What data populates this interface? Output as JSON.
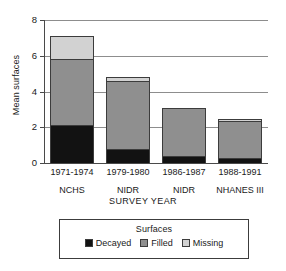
{
  "chart_data": {
    "type": "bar",
    "subtype": "stacked-vertical",
    "title": "",
    "xlabel": "SURVEY YEAR",
    "ylabel": "Mean surfaces",
    "ylim": [
      0,
      8
    ],
    "yticks": [
      0,
      2,
      4,
      6,
      8
    ],
    "ytick_labels": [
      "0",
      "2",
      "4",
      "6",
      "8"
    ],
    "grid": true,
    "grid_axis": "y",
    "legend_position": "below-plot",
    "legend_title": "Surfaces",
    "categories": [
      "1971-1974 NCHS",
      "1979-1980 NIDR",
      "1986-1987 NIDR",
      "1988-1991 NHANES III"
    ],
    "category_lines": [
      {
        "year": "1971-1974",
        "survey": "NCHS"
      },
      {
        "year": "1979-1980",
        "survey": "NIDR"
      },
      {
        "year": "1986-1987",
        "survey": "NIDR"
      },
      {
        "year": "1988-1991",
        "survey": "NHANES III"
      }
    ],
    "series": [
      {
        "name": "Decayed",
        "color": "#121212",
        "values": [
          2.1,
          0.8,
          0.4,
          0.3
        ]
      },
      {
        "name": "Filled",
        "color": "#8f8f8f",
        "values": [
          3.7,
          3.8,
          2.65,
          2.05
        ]
      },
      {
        "name": "Missing",
        "color": "#d2d2d2",
        "values": [
          1.3,
          0.2,
          0.05,
          0.1
        ]
      }
    ],
    "totals": [
      7.1,
      4.8,
      3.1,
      2.45
    ]
  },
  "axis": {
    "y_title": "Mean surfaces",
    "x_title": "SURVEY YEAR",
    "y_tick_0": "0",
    "y_tick_1": "2",
    "y_tick_2": "4",
    "y_tick_3": "6",
    "y_tick_4": "8"
  },
  "legend": {
    "title": "Surfaces",
    "items": [
      {
        "label": "Decayed",
        "color": "#121212"
      },
      {
        "label": "Filled",
        "color": "#8f8f8f"
      },
      {
        "label": "Missing",
        "color": "#d2d2d2"
      }
    ]
  },
  "colors": {
    "decayed": "#121212",
    "filled": "#8f8f8f",
    "missing": "#d2d2d2",
    "axis": "#4a4a4a",
    "grid": "#8d8d8d",
    "background": "#ffffff"
  }
}
